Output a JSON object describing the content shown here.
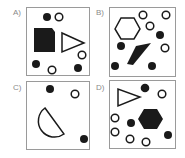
{
  "panels": [
    {
      "label": "A)",
      "shapes": [
        "filled-circle",
        "hollow-circle",
        "filled-square-clipped-corner",
        "hollow-triangle-right",
        "hollow-circle",
        "filled-circle",
        "hollow-circle",
        "filled-circle"
      ]
    },
    {
      "label": "B)",
      "shapes": [
        "hollow-hexagon",
        "hollow-circle",
        "hollow-circle",
        "hollow-circle",
        "hollow-circle",
        "filled-circle",
        "filled-circle",
        "filled-circle",
        "filled-circle",
        "filled-parallelogram"
      ]
    },
    {
      "label": "C)",
      "shapes": [
        "filled-circle",
        "hollow-circle",
        "hollow-semicircle",
        "filled-circle"
      ]
    },
    {
      "label": "D)",
      "shapes": [
        "hollow-triangle-right",
        "filled-circle",
        "hollow-circle",
        "filled-hexagon",
        "hollow-circle",
        "hollow-circle",
        "hollow-circle",
        "hollow-circle",
        "filled-circle",
        "filled-circle"
      ]
    }
  ],
  "colors": {
    "fill": "#1a1a1a",
    "stroke": "#1a1a1a",
    "border": "#9a9a9a",
    "label": "#8a8a8a"
  }
}
